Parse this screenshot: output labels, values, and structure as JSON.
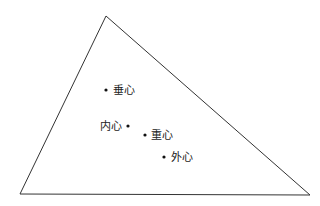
{
  "diagram": {
    "type": "triangle-centers",
    "stroke_color": "#333333",
    "triangle": {
      "vertices": [
        [
          106,
          16
        ],
        [
          20,
          194
        ],
        [
          310,
          195
        ]
      ]
    },
    "points": [
      {
        "id": "orthocenter",
        "label": "垂心",
        "x": 106,
        "y": 90,
        "label_x": 113,
        "label_y": 94,
        "anchor": "start"
      },
      {
        "id": "incenter",
        "label": "内心",
        "x": 128,
        "y": 126,
        "label_x": 122,
        "label_y": 130,
        "anchor": "end"
      },
      {
        "id": "centroid",
        "label": "重心",
        "x": 145,
        "y": 135,
        "label_x": 151,
        "label_y": 139,
        "anchor": "start"
      },
      {
        "id": "circumcenter",
        "label": "外心",
        "x": 164,
        "y": 157,
        "label_x": 171,
        "label_y": 161,
        "anchor": "start"
      }
    ]
  }
}
